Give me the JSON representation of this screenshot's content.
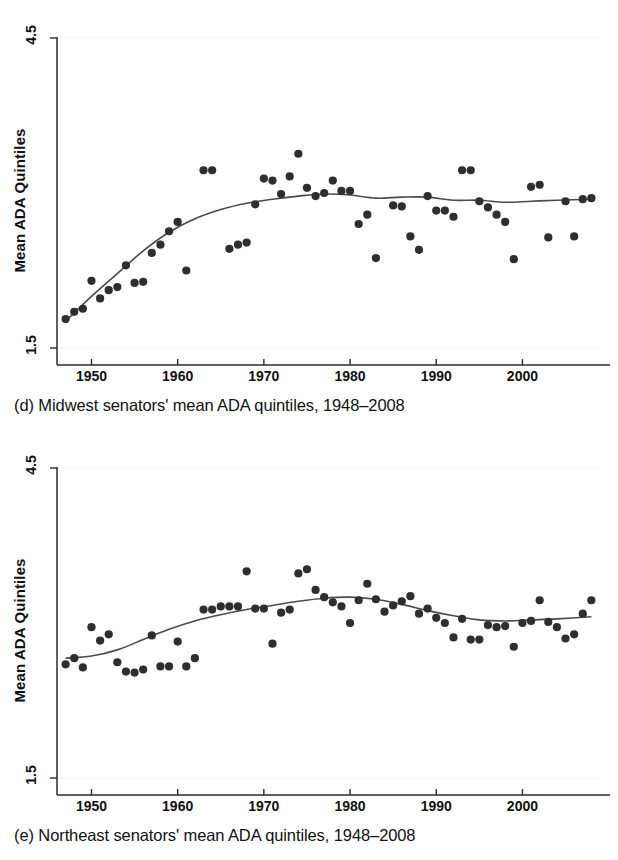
{
  "figure": {
    "title_d": "(d) Midwest senators' mean ADA quintiles, 1948–2008",
    "title_e": "(e) Northeast senators' mean ADA quintiles, 1948–2008"
  },
  "panel_d": {
    "caption": "(d) Midwest senators' mean ADA quintiles, 1948–2008",
    "ylabel": "Mean ADA Quintiles",
    "ytick_top": "4.5",
    "ytick_bottom": "1.5",
    "xticks": [
      "1950",
      "1960",
      "1970",
      "1980",
      "1990",
      "2000"
    ]
  },
  "panel_e": {
    "caption": "(e) Northeast senators' mean ADA quintiles, 1948–2008",
    "ylabel": "Mean ADA Quintiles",
    "ytick_top": "4.5",
    "ytick_bottom": "1.5",
    "xticks": [
      "1950",
      "1960",
      "1970",
      "1980",
      "1990",
      "2000"
    ]
  },
  "colors": {
    "dot": "#2e2e2e",
    "smooth_line": "#4b4b4b",
    "axis": "#2b2b2b",
    "background": "#ffffff"
  },
  "chart_data": [
    {
      "id": "panel_d",
      "type": "scatter",
      "title": "(d) Midwest senators' mean ADA quintiles, 1948–2008",
      "xlabel": "",
      "ylabel": "Mean ADA Quintiles",
      "xlim": [
        1946.0,
        2009.0
      ],
      "ylim": [
        1.5,
        4.5
      ],
      "yticks": [
        1.5,
        4.5
      ],
      "xticks": [
        1950,
        1960,
        1970,
        1980,
        1990,
        2000
      ],
      "grid": false,
      "legend": "none",
      "series": [
        {
          "name": "Mean ADA quintile (biennial)",
          "type": "scatter",
          "x": [
            1947,
            1948,
            1949,
            1950,
            1951,
            1952,
            1953,
            1954,
            1955,
            1956,
            1957,
            1958,
            1959,
            1960,
            1961,
            1963,
            1964,
            1966,
            1967,
            1968,
            1969,
            1970,
            1971,
            1972,
            1973,
            1974,
            1975,
            1976,
            1977,
            1978,
            1979,
            1980,
            1981,
            1982,
            1983,
            1985,
            1986,
            1987,
            1988,
            1989,
            1990,
            1991,
            1992,
            1993,
            1994,
            1995,
            1996,
            1997,
            1998,
            1999,
            2001,
            2002,
            2003,
            2005,
            2006,
            2007,
            2008
          ],
          "y": [
            1.78,
            1.85,
            1.88,
            2.15,
            1.98,
            2.06,
            2.09,
            2.3,
            2.13,
            2.14,
            2.42,
            2.5,
            2.63,
            2.72,
            2.25,
            3.22,
            3.22,
            2.46,
            2.5,
            2.52,
            2.89,
            3.14,
            3.12,
            2.99,
            3.16,
            3.38,
            3.05,
            2.97,
            3.0,
            3.12,
            3.02,
            3.02,
            2.7,
            2.79,
            2.37,
            2.88,
            2.87,
            2.58,
            2.45,
            2.97,
            2.83,
            2.83,
            2.77,
            3.22,
            3.22,
            2.92,
            2.86,
            2.79,
            2.72,
            2.36,
            3.06,
            3.08,
            2.57,
            2.92,
            2.58,
            2.94,
            2.95
          ]
        },
        {
          "name": "Lowess smooth",
          "type": "line",
          "x": [
            1947,
            1950,
            1953,
            1956,
            1959,
            1962,
            1965,
            1968,
            1971,
            1974,
            1977,
            1980,
            1983,
            1986,
            1989,
            1992,
            1995,
            1998,
            2001,
            2004,
            2008
          ],
          "y": [
            1.76,
            2.0,
            2.22,
            2.44,
            2.62,
            2.75,
            2.84,
            2.9,
            2.94,
            2.97,
            2.99,
            2.98,
            2.95,
            2.96,
            2.96,
            2.93,
            2.93,
            2.91,
            2.92,
            2.93,
            2.94
          ]
        }
      ]
    },
    {
      "id": "panel_e",
      "type": "scatter",
      "title": "(e) Northeast senators' mean ADA quintiles, 1948–2008",
      "xlabel": "",
      "ylabel": "Mean ADA Quintiles",
      "xlim": [
        1946.0,
        2009.0
      ],
      "ylim": [
        1.5,
        4.5
      ],
      "yticks": [
        1.5,
        4.5
      ],
      "xticks": [
        1950,
        1960,
        1970,
        1980,
        1990,
        2000
      ],
      "grid": false,
      "legend": "none",
      "series": [
        {
          "name": "Mean ADA quintile (biennial)",
          "type": "scatter",
          "x": [
            1947,
            1948,
            1949,
            1950,
            1951,
            1952,
            1953,
            1954,
            1955,
            1956,
            1957,
            1958,
            1959,
            1960,
            1961,
            1962,
            1963,
            1964,
            1965,
            1966,
            1967,
            1968,
            1969,
            1970,
            1971,
            1972,
            1973,
            1974,
            1975,
            1976,
            1977,
            1978,
            1979,
            1980,
            1981,
            1982,
            1983,
            1984,
            1985,
            1986,
            1987,
            1988,
            1989,
            1990,
            1991,
            1992,
            1993,
            1994,
            1995,
            1996,
            1997,
            1998,
            1999,
            2000,
            2001,
            2002,
            2003,
            2004,
            2005,
            2006,
            2007,
            2008
          ],
          "y": [
            2.6,
            2.66,
            2.57,
            2.96,
            2.83,
            2.89,
            2.62,
            2.53,
            2.52,
            2.55,
            2.88,
            2.58,
            2.58,
            2.82,
            2.58,
            2.66,
            3.13,
            3.13,
            3.16,
            3.16,
            3.16,
            3.5,
            3.14,
            3.14,
            2.8,
            3.1,
            3.13,
            3.48,
            3.52,
            3.32,
            3.25,
            3.2,
            3.16,
            3.0,
            3.22,
            3.38,
            3.23,
            3.11,
            3.17,
            3.21,
            3.26,
            3.09,
            3.14,
            3.05,
            3.0,
            2.86,
            3.04,
            2.84,
            2.84,
            2.98,
            2.96,
            2.97,
            2.77,
            3.0,
            3.02,
            3.22,
            3.01,
            2.96,
            2.85,
            2.89,
            3.09,
            3.22
          ]
        },
        {
          "name": "Lowess smooth",
          "type": "line",
          "x": [
            1947,
            1950,
            1953,
            1956,
            1959,
            1962,
            1965,
            1968,
            1971,
            1974,
            1977,
            1980,
            1983,
            1986,
            1989,
            1992,
            1995,
            1998,
            2001,
            2004,
            2008
          ],
          "y": [
            2.66,
            2.68,
            2.74,
            2.84,
            2.94,
            3.02,
            3.08,
            3.13,
            3.17,
            3.21,
            3.24,
            3.25,
            3.23,
            3.18,
            3.12,
            3.07,
            3.03,
            3.02,
            3.03,
            3.04,
            3.06
          ]
        }
      ]
    }
  ]
}
